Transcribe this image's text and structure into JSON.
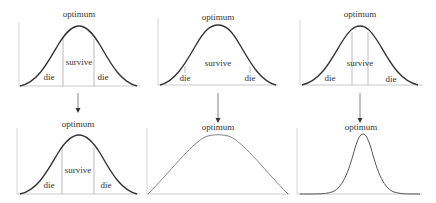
{
  "colors": {
    "curve_dark": "#333333",
    "curve_light": "#777777",
    "axis": "#bbbbbb",
    "divider": "#aaaaaa",
    "text": "#333333",
    "arrow": "#444444"
  },
  "panels": [
    {
      "id": "top-left",
      "peak_label": "optimum",
      "left_label": "die",
      "center_label": "survive",
      "right_label": "die"
    },
    {
      "id": "top-middle",
      "peak_label": "optimum",
      "left_label": "die",
      "center_label": "survive",
      "right_label": "die"
    },
    {
      "id": "top-right",
      "peak_label": "optimum",
      "left_label": "die",
      "center_label": "survive",
      "right_label": "die"
    },
    {
      "id": "bottom-left",
      "peak_label": "optimum",
      "left_label": "die",
      "center_label": "survive",
      "right_label": "die"
    },
    {
      "id": "bottom-middle",
      "peak_label": "optimum"
    },
    {
      "id": "bottom-right",
      "peak_label": "optimum"
    }
  ]
}
